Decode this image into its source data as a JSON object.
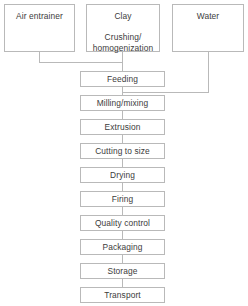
{
  "diagram": {
    "style": {
      "border_color": "#b9b9b9",
      "line_color": "#b9b9b9",
      "text_color": "#3c3c3c",
      "background": "#ffffff"
    },
    "inputs": [
      {
        "id": "air-entrainer",
        "label": "Air entrainer",
        "x": 4,
        "y": 4,
        "w": 71,
        "h": 48
      },
      {
        "id": "clay",
        "label": "Clay",
        "sub_line_1": "Crushing/",
        "sub_line_2": "homogenization",
        "x": 86,
        "y": 4,
        "w": 74,
        "h": 48
      },
      {
        "id": "water",
        "label": "Water",
        "x": 172,
        "y": 4,
        "w": 72,
        "h": 48
      }
    ],
    "steps": [
      {
        "id": "feeding",
        "label": "Feeding",
        "x": 80,
        "y": 71,
        "w": 85,
        "h": 16
      },
      {
        "id": "milling-mixing",
        "label": "Milling/mixing",
        "x": 80,
        "y": 95,
        "w": 85,
        "h": 16
      },
      {
        "id": "extrusion",
        "label": "Extrusion",
        "x": 80,
        "y": 119,
        "w": 85,
        "h": 16
      },
      {
        "id": "cutting-to-size",
        "label": "Cutting to size",
        "x": 80,
        "y": 143,
        "w": 85,
        "h": 16
      },
      {
        "id": "drying",
        "label": "Drying",
        "x": 80,
        "y": 167,
        "w": 85,
        "h": 16
      },
      {
        "id": "firing",
        "label": "Firing",
        "x": 80,
        "y": 191,
        "w": 85,
        "h": 16
      },
      {
        "id": "quality-control",
        "label": "Quality control",
        "x": 80,
        "y": 215,
        "w": 85,
        "h": 16
      },
      {
        "id": "packaging",
        "label": "Packaging",
        "x": 80,
        "y": 239,
        "w": 85,
        "h": 16
      },
      {
        "id": "storage",
        "label": "Storage",
        "x": 80,
        "y": 263,
        "w": 85,
        "h": 16
      },
      {
        "id": "transport",
        "label": "Transport",
        "x": 80,
        "y": 287,
        "w": 85,
        "h": 16
      }
    ],
    "connectors": [
      {
        "id": "air-entrainer-to-feeding",
        "points": "39,52 39,62 122,62 122,71"
      },
      {
        "id": "clay-to-feeding",
        "points": "122,52 122,71"
      },
      {
        "id": "water-to-milling",
        "points": "208,52 208,92 122,92"
      },
      {
        "id": "feeding-to-milling",
        "points": "122,87 122,95"
      },
      {
        "id": "milling-to-extrusion",
        "points": "122,111 122,119"
      },
      {
        "id": "extrusion-to-cutting",
        "points": "122,135 122,143"
      },
      {
        "id": "cutting-to-drying",
        "points": "122,159 122,167"
      },
      {
        "id": "drying-to-firing",
        "points": "122,183 122,191"
      },
      {
        "id": "firing-to-quality-control",
        "points": "122,207 122,215"
      },
      {
        "id": "quality-control-to-packaging",
        "points": "122,231 122,239"
      },
      {
        "id": "packaging-to-storage",
        "points": "122,255 122,263"
      },
      {
        "id": "storage-to-transport",
        "points": "122,279 122,287"
      }
    ]
  }
}
